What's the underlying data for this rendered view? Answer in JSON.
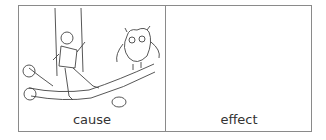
{
  "worksheet": {
    "cells": [
      {
        "label": "cause",
        "illustration": "boy-on-swing-and-owl-on-branch"
      },
      {
        "label": "effect",
        "illustration": null
      }
    ]
  }
}
